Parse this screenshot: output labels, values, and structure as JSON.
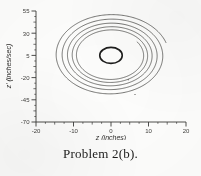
{
  "figure": {
    "caption": "Problem 2(b).",
    "plot_type": "phase-plane"
  },
  "axes": {
    "x_title": "z (inches)",
    "y_title": "z' (inches/sec)",
    "x_ticks": [
      "-20",
      "-10",
      "0",
      "10",
      "20"
    ],
    "y_ticks": [
      "55",
      "30",
      "5",
      "-20",
      "-45",
      "-70"
    ]
  },
  "colors": {
    "ink": "#3a3a38",
    "curve": "#4a4a47",
    "limit_cycle": "#1d1d1c",
    "paper": "#fdfdfc"
  },
  "chart_data": {
    "type": "line",
    "title": "Problem 2(b).",
    "xlabel": "z (inches)",
    "ylabel": "z' (inches/sec)",
    "xlim": [
      -20,
      20
    ],
    "ylim": [
      -70,
      55
    ],
    "xticks": [
      -20,
      -10,
      0,
      10,
      20
    ],
    "yticks": [
      -70,
      -45,
      -20,
      5,
      30,
      55
    ],
    "grid": false,
    "legend": null,
    "minor_ticks": true,
    "spines": [
      "left",
      "bottom"
    ],
    "series": [
      {
        "name": "spiral trajectory",
        "kind": "parametric-spiral",
        "center": [
          0.0,
          5.0
        ],
        "x_amplitude_start": 15.4,
        "x_amplitude_end": 8.6,
        "y_amplitude_start": 47.0,
        "y_amplitude_end": 26.0,
        "turns": 5.05,
        "start_angle_deg": 18,
        "direction": "clockwise",
        "comment": "Elliptical spiral, radius decays roughly geometrically per revolution; outer winding terminates leaving a visible gap on the right side near z = 15."
      },
      {
        "name": "limit cycle",
        "kind": "closed-ellipse",
        "center": [
          0.0,
          5.0
        ],
        "x_radius": 3.0,
        "y_radius": 9.0,
        "linewidth": 1.6
      }
    ],
    "markers": [
      {
        "x": 4.6,
        "y": -22.5,
        "kind": "speck"
      },
      {
        "x": 6.4,
        "y": -39.0,
        "kind": "speck"
      }
    ]
  }
}
